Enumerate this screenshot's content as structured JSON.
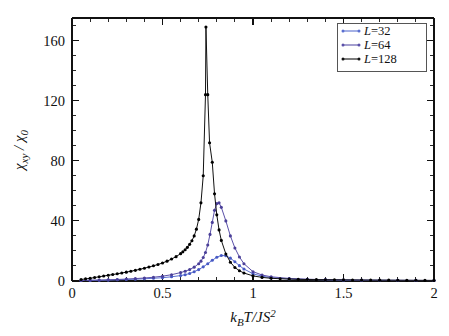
{
  "figure": {
    "background": "#ffffff",
    "frame_color": "#111111"
  },
  "chart_data": {
    "type": "line",
    "title": "",
    "subtitle": "",
    "xlabel": "k_B T/JS^2",
    "xlabel_parts": {
      "k": "k",
      "B": "B",
      "T_over": "T/JS",
      "exp": "2"
    },
    "ylabel": "chi_xy / chi_0",
    "ylabel_parts": {
      "chi1": "χ",
      "sub1": "xy",
      "slash": " / ",
      "chi2": "χ",
      "sub2": "0"
    },
    "xlim": [
      0,
      2
    ],
    "ylim": [
      0,
      175
    ],
    "xticks": [
      0,
      0.5,
      1,
      1.5,
      2
    ],
    "xticklabels": [
      "0",
      "0.5",
      "1",
      "1.5",
      "2"
    ],
    "xminor_step": 0.1,
    "yticks": [
      0,
      40,
      80,
      120,
      160
    ],
    "yticklabels": [
      "0",
      "40",
      "80",
      "120",
      "160"
    ],
    "yminor_step": 10,
    "grid": false,
    "legend_position": "top-right",
    "markers": "filled-circle",
    "series": [
      {
        "name": "L=32",
        "label_prefix": "L",
        "label_value": "=32",
        "color": "#5a6fd0",
        "marker_color": "#4759c4",
        "x": [
          0.05,
          0.1,
          0.15,
          0.2,
          0.25,
          0.3,
          0.35,
          0.4,
          0.45,
          0.5,
          0.55,
          0.6,
          0.625,
          0.65,
          0.675,
          0.7,
          0.725,
          0.75,
          0.775,
          0.8,
          0.825,
          0.85,
          0.875,
          0.9,
          0.925,
          0.95,
          1.0,
          1.05,
          1.1,
          1.2,
          1.3,
          1.4,
          1.5,
          1.6,
          1.7,
          1.8,
          1.9,
          2.0
        ],
        "y": [
          0.3,
          0.4,
          0.5,
          0.6,
          0.8,
          1.0,
          1.2,
          1.5,
          1.8,
          2.2,
          2.8,
          3.6,
          4.2,
          5.0,
          6.2,
          7.6,
          9.4,
          11.5,
          13.8,
          15.8,
          17.0,
          16.8,
          15.2,
          12.8,
          10.2,
          8.0,
          4.8,
          3.2,
          2.2,
          1.4,
          1.0,
          0.8,
          0.6,
          0.5,
          0.45,
          0.4,
          0.35,
          0.3
        ]
      },
      {
        "name": "L=64",
        "label_prefix": "L",
        "label_value": "=64",
        "color": "#5a50a8",
        "marker_color": "#4a3f98",
        "x": [
          0.05,
          0.1,
          0.15,
          0.2,
          0.25,
          0.3,
          0.35,
          0.4,
          0.45,
          0.5,
          0.55,
          0.6,
          0.625,
          0.65,
          0.675,
          0.7,
          0.7125,
          0.725,
          0.7375,
          0.75,
          0.7625,
          0.775,
          0.7875,
          0.8,
          0.8125,
          0.825,
          0.85,
          0.875,
          0.9,
          0.925,
          0.95,
          1.0,
          1.05,
          1.1,
          1.2,
          1.3,
          1.4,
          1.5,
          1.6,
          1.7,
          1.8,
          1.9,
          2.0
        ],
        "y": [
          0.3,
          0.5,
          0.6,
          0.8,
          1.0,
          1.3,
          1.6,
          2.0,
          2.5,
          3.2,
          4.2,
          5.6,
          6.5,
          7.6,
          9.2,
          11.5,
          13.2,
          15.6,
          19.0,
          24.0,
          31.0,
          39.0,
          47.0,
          51.5,
          52.0,
          49.0,
          40.0,
          30.0,
          22.0,
          16.0,
          11.5,
          6.2,
          4.0,
          2.8,
          1.7,
          1.2,
          0.9,
          0.7,
          0.6,
          0.5,
          0.45,
          0.4,
          0.35
        ]
      },
      {
        "name": "L=128",
        "label_prefix": "L",
        "label_value": "=128",
        "color": "#111111",
        "marker_color": "#000000",
        "x": [
          0.05,
          0.075,
          0.1,
          0.125,
          0.15,
          0.175,
          0.2,
          0.225,
          0.25,
          0.275,
          0.3,
          0.325,
          0.35,
          0.375,
          0.4,
          0.425,
          0.45,
          0.475,
          0.5,
          0.525,
          0.55,
          0.575,
          0.6,
          0.6125,
          0.625,
          0.6375,
          0.65,
          0.6625,
          0.675,
          0.6875,
          0.7,
          0.7125,
          0.725,
          0.7375,
          0.74,
          0.75,
          0.76,
          0.775,
          0.7875,
          0.8,
          0.8125,
          0.825,
          0.85,
          0.875,
          0.9,
          0.925,
          0.95,
          1.0,
          1.05,
          1.1,
          1.15,
          1.2,
          1.25,
          1.3,
          1.35,
          1.4,
          1.45,
          1.5,
          1.55,
          1.6,
          1.65,
          1.7,
          1.75,
          1.8,
          1.85,
          1.9,
          1.95,
          2.0
        ],
        "y": [
          1.0,
          1.4,
          1.8,
          2.3,
          2.8,
          3.3,
          3.8,
          4.3,
          4.8,
          5.3,
          5.9,
          6.5,
          7.1,
          7.8,
          8.5,
          9.3,
          10.1,
          11.0,
          12.0,
          13.2,
          14.6,
          16.2,
          18.2,
          19.4,
          20.8,
          22.4,
          24.4,
          26.8,
          30.0,
          34.5,
          41.0,
          52.0,
          70.0,
          124.0,
          169.0,
          124.0,
          92.0,
          79.0,
          58.0,
          44.0,
          34.0,
          27.0,
          18.0,
          12.5,
          9.0,
          6.8,
          5.3,
          3.4,
          2.4,
          1.8,
          1.5,
          1.3,
          1.1,
          1.0,
          0.9,
          0.85,
          0.8,
          0.75,
          0.7,
          0.65,
          0.6,
          0.58,
          0.55,
          0.5,
          0.48,
          0.45,
          0.42,
          0.4
        ]
      }
    ]
  },
  "legend": {
    "entries": [
      {
        "label": "L=32",
        "italic_part": "L",
        "rest": "=32",
        "color": "#5a6fd0"
      },
      {
        "label": "L=64",
        "italic_part": "L",
        "rest": "=64",
        "color": "#5a50a8"
      },
      {
        "label": "L=128",
        "italic_part": "L",
        "rest": "=128",
        "color": "#111111"
      }
    ]
  }
}
